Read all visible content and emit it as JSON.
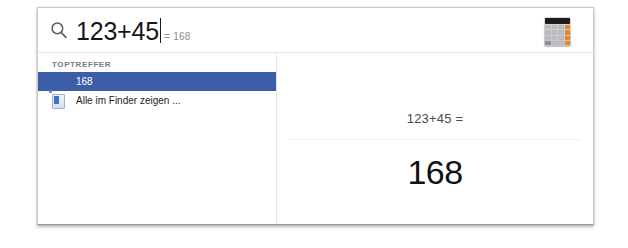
{
  "window": {
    "kind": "spotlight-search-window"
  },
  "search": {
    "icon": "search-icon",
    "query": "123+45",
    "inline_result_suffix": "= 168",
    "app_icon": "calculator-icon"
  },
  "results": {
    "group_label": "TOPTREFFER",
    "items": [
      {
        "icon": "calculator-icon",
        "label": "168",
        "selected": true
      },
      {
        "icon": "finder-icon",
        "label": "Alle im Finder zeigen ...",
        "selected": false
      }
    ]
  },
  "preview": {
    "expression": "123+45 =",
    "result": "168"
  },
  "colors": {
    "selection_blue": "#3c5da8",
    "accent_orange": "#e8862a",
    "text_primary": "#161616",
    "text_muted": "#8c8c8c",
    "window_border": "#c9c9c9"
  }
}
